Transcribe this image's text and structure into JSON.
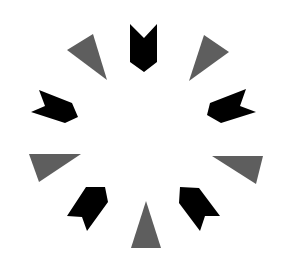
{
  "graphic": {
    "type": "radial-spinner",
    "width": 288,
    "height": 269,
    "background": "#ffffff",
    "colors": {
      "dark": "#000000",
      "gray": "#5e5e5e"
    },
    "shapes": [
      {
        "name": "chevron-top",
        "kind": "chevron",
        "color": "dark",
        "points": "130,24 144,38 157,24 157,62 144,72 130,62"
      },
      {
        "name": "triangle-top-right",
        "kind": "triangle",
        "color": "gray",
        "points": "204,35 229,52 189,81"
      },
      {
        "name": "chevron-right",
        "kind": "chevron",
        "color": "dark",
        "points": "210,103 246,89 240,106 256,112 221,123 207,115"
      },
      {
        "name": "triangle-right",
        "kind": "triangle",
        "color": "gray",
        "points": "212,156 263,156 256,184"
      },
      {
        "name": "chevron-bottom-right",
        "kind": "chevron",
        "color": "dark",
        "points": "180,187 199,188 220,216 205,216 200,231 179,203"
      },
      {
        "name": "triangle-bottom",
        "kind": "triangle",
        "color": "gray",
        "points": "146,201 161,248 131,248"
      },
      {
        "name": "chevron-bottom-left",
        "kind": "chevron",
        "color": "dark",
        "points": "86,187 105,187 108,202 87,231 82,217 67,216"
      },
      {
        "name": "triangle-left",
        "kind": "triangle",
        "color": "gray",
        "points": "29,154 81,154 39,182"
      },
      {
        "name": "chevron-left",
        "kind": "chevron",
        "color": "dark",
        "points": "39,90 72,103 78,117 65,123 31,112 45,106"
      },
      {
        "name": "triangle-top-left",
        "kind": "triangle",
        "color": "gray",
        "points": "67,50 93,34 107,80"
      }
    ]
  }
}
